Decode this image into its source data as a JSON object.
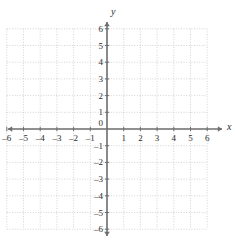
{
  "figure": {
    "kind": "cartesian-coordinate-plane",
    "background_color": "#ffffff",
    "grid_color": "#c8c8c8",
    "axis_color": "#6e6e6e",
    "label_color": "#2b2b2b"
  },
  "axes": {
    "x": {
      "name": "x",
      "min": -6,
      "max": 6,
      "step": 1,
      "arrow_both_ends": true,
      "tick_labels": [
        "–6",
        "–5",
        "–4",
        "–3",
        "–2",
        "–1",
        "1",
        "2",
        "3",
        "4",
        "5",
        "6"
      ],
      "tick_values": [
        -6,
        -5,
        -4,
        -3,
        -2,
        -1,
        1,
        2,
        3,
        4,
        5,
        6
      ]
    },
    "y": {
      "name": "y",
      "min": -6,
      "max": 6,
      "step": 1,
      "arrow_both_ends": true,
      "tick_labels": [
        "6",
        "5",
        "4",
        "3",
        "2",
        "1",
        "–1",
        "–2",
        "–3",
        "–4",
        "–5",
        "–6"
      ],
      "tick_values": [
        6,
        5,
        4,
        3,
        2,
        1,
        -1,
        -2,
        -3,
        -4,
        -5,
        -6
      ]
    }
  },
  "origin_label": "0",
  "chart_data": {
    "type": "scatter",
    "title": "",
    "xlabel": "x",
    "ylabel": "y",
    "xlim": [
      -6,
      6
    ],
    "ylim": [
      -6,
      6
    ],
    "xticks": [
      -6,
      -5,
      -4,
      -3,
      -2,
      -1,
      0,
      1,
      2,
      3,
      4,
      5,
      6
    ],
    "yticks": [
      -6,
      -5,
      -4,
      -3,
      -2,
      -1,
      0,
      1,
      2,
      3,
      4,
      5,
      6
    ],
    "grid": true,
    "grid_style": "dotted",
    "legend": false,
    "series": [],
    "annotations": []
  }
}
